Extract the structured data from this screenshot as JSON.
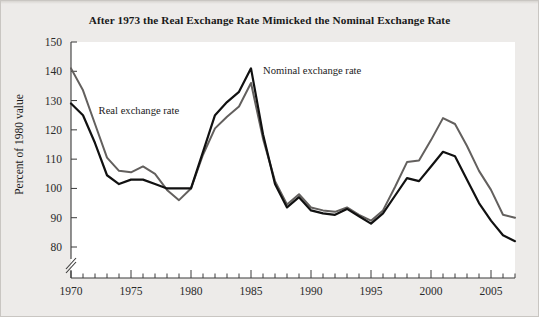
{
  "figure": {
    "background_color": "#edebe9",
    "plot_background_color": "#ffffff",
    "title": "After 1973 the Real Exchange Rate Mimicked the Nominal Exchange Rate"
  },
  "axes": {
    "y_axis_title": "Percent of 1980 value",
    "y_ticks": [
      "150",
      "140",
      "130",
      "120",
      "110",
      "100",
      "90",
      "80"
    ],
    "x_ticks": [
      "1970",
      "1975",
      "1980",
      "1985",
      "1990",
      "1995",
      "2000",
      "2005"
    ],
    "axis_break_note": "y-axis break below 80"
  },
  "annotations": {
    "real_label": "Real exchange rate",
    "nominal_label": "Nominal exchange rate"
  },
  "chart_data": {
    "type": "line",
    "title": "After 1973 the Real Exchange Rate Mimicked the Nominal Exchange Rate",
    "xlabel": "",
    "ylabel": "Percent of 1980 value",
    "xlim": [
      1970,
      2007
    ],
    "ylim": [
      77,
      150
    ],
    "ytick_values": [
      150,
      140,
      130,
      120,
      110,
      100,
      90,
      80
    ],
    "xtick_values": [
      1970,
      1975,
      1980,
      1985,
      1990,
      1995,
      2000,
      2005
    ],
    "x_minor_tick_interval": 1,
    "grid": false,
    "legend_position": "inline-annotations",
    "y_axis_break": true,
    "x": [
      1970,
      1971,
      1972,
      1973,
      1974,
      1975,
      1976,
      1977,
      1978,
      1979,
      1980,
      1981,
      1982,
      1983,
      1984,
      1985,
      1986,
      1987,
      1988,
      1989,
      1990,
      1991,
      1992,
      1993,
      1994,
      1995,
      1996,
      1997,
      1998,
      1999,
      2000,
      2001,
      2002,
      2003,
      2004,
      2005,
      2006,
      2007
    ],
    "series": [
      {
        "name": "Real exchange rate",
        "color": "#63605e",
        "line_width": 2.0,
        "values": [
          141.0,
          133.5,
          122.0,
          110.5,
          106.0,
          105.5,
          107.5,
          105.0,
          99.5,
          96.0,
          100.0,
          111.5,
          120.5,
          124.5,
          128.0,
          136.0,
          117.0,
          102.5,
          94.5,
          98.0,
          93.5,
          92.5,
          92.0,
          93.5,
          91.0,
          89.0,
          92.5,
          100.5,
          109.0,
          109.5,
          116.5,
          124.0,
          122.0,
          114.5,
          106.0,
          99.5,
          91.0,
          90.0
        ]
      },
      {
        "name": "Nominal exchange rate",
        "color": "#111111",
        "line_width": 2.2,
        "values": [
          129.0,
          125.0,
          115.5,
          104.5,
          101.5,
          103.0,
          103.0,
          101.5,
          100.0,
          100.0,
          100.0,
          112.5,
          125.0,
          129.5,
          133.0,
          141.0,
          118.5,
          101.5,
          93.5,
          97.0,
          92.5,
          91.5,
          91.0,
          93.0,
          90.5,
          88.0,
          91.5,
          97.5,
          103.5,
          102.5,
          107.5,
          112.5,
          111.0,
          103.0,
          95.0,
          89.0,
          84.0,
          82.0
        ]
      }
    ],
    "annotations": [
      {
        "text": "Real exchange rate",
        "x": 1972.3,
        "y": 125.5
      },
      {
        "text": "Nominal exchange rate",
        "x": 1986.0,
        "y": 139.0
      }
    ]
  }
}
